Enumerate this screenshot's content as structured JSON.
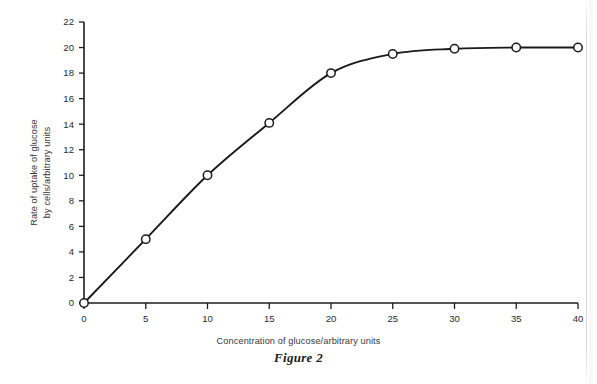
{
  "figure": {
    "caption": "Figure 2"
  },
  "chart_data": {
    "type": "line",
    "title": "",
    "xlabel": "Concentration of glucose/arbitrary units",
    "ylabel_line1": "Rate of uptake of glucose",
    "ylabel_line2": "by cells/arbitrary units",
    "xlim": [
      0,
      40
    ],
    "ylim": [
      0,
      22
    ],
    "xticks": [
      0,
      5,
      10,
      15,
      20,
      25,
      30,
      35,
      40
    ],
    "yticks": [
      0,
      2,
      4,
      6,
      8,
      10,
      12,
      14,
      16,
      18,
      20,
      22
    ],
    "xtick_labels": [
      "0",
      "5",
      "10",
      "15",
      "20",
      "25",
      "30",
      "35",
      "40"
    ],
    "ytick_labels": [
      "0",
      "2",
      "4",
      "6",
      "8",
      "10",
      "12",
      "14",
      "16",
      "18",
      "20",
      "22"
    ],
    "grid": false,
    "legend": false,
    "marker": "open-circle",
    "line_color": "#1a1a1a",
    "marker_fill": "#ffffff",
    "series": [
      {
        "name": "Rate of uptake of glucose",
        "x": [
          0,
          5,
          10,
          15,
          20,
          25,
          30,
          35,
          40
        ],
        "values": [
          0,
          5.0,
          10.0,
          14.1,
          18.0,
          19.5,
          19.9,
          20.0,
          20.0
        ]
      }
    ]
  }
}
